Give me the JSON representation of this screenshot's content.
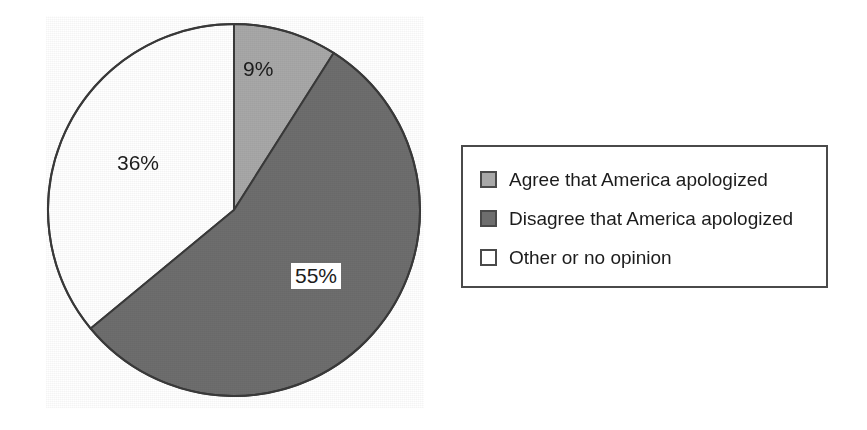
{
  "chart_data": {
    "type": "pie",
    "title": "",
    "subtitle": "",
    "xlabel": "",
    "ylabel": "",
    "grid": false,
    "legend_position": "right",
    "start_angle_deg": 0,
    "direction": "clockwise",
    "categories": [
      "Agree that America apologized",
      "Disagree that America apologized",
      "Other or no opinion"
    ],
    "values": [
      9,
      55,
      36
    ],
    "value_labels": [
      "9%",
      "55%",
      "36%"
    ],
    "slice_colors": [
      "#a8a8a8",
      "#6e6e6e",
      "#ffffff"
    ],
    "slices": [
      {
        "label": "Agree that America apologized",
        "value": 9,
        "value_label": "9%",
        "color": "#a8a8a8",
        "start_deg": 0,
        "end_deg": 32.4,
        "label_boxed": false
      },
      {
        "label": "Disagree that America apologized",
        "value": 55,
        "value_label": "55%",
        "color": "#6e6e6e",
        "start_deg": 32.4,
        "end_deg": 230.4,
        "label_boxed": true
      },
      {
        "label": "Other or no opinion",
        "value": 36,
        "value_label": "36%",
        "color": "#ffffff",
        "start_deg": 230.4,
        "end_deg": 360,
        "label_boxed": false
      }
    ]
  },
  "pie": {
    "outline_color": "#3a3a3a",
    "labels": {
      "agree": "9%",
      "disagree": "55%",
      "other": "36%"
    }
  },
  "legend": {
    "border_color": "#4a4a4a",
    "items": [
      {
        "label": "Agree that America apologized",
        "color": "#a8a8a8",
        "swatch": "legend-swatch-agree"
      },
      {
        "label": "Disagree that America apologized",
        "color": "#6e6e6e",
        "swatch": "legend-swatch-disagree"
      },
      {
        "label": "Other or no opinion",
        "color": "#ffffff",
        "swatch": "legend-swatch-other"
      }
    ]
  }
}
